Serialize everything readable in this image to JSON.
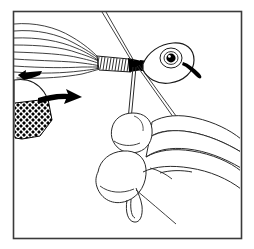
{
  "figure": {
    "title": "Fly tying step illustration",
    "description": "Black and white line drawing of a fishing fly being tied: hair fibers flare to the left, a thread wrap band binds them behind an oval head with an eye, and a hand below pinches a thread loop.",
    "width_px": 254,
    "height_px": 249,
    "style": "pen-and-ink line art",
    "background_color": "#ffffff",
    "line_color": "#1a1a1a",
    "fill_color": "#000000",
    "border": {
      "label": "frame border",
      "color": "#3a3a3a",
      "stroke_width": 1.6,
      "x": 13,
      "y": 11,
      "width": 228,
      "height": 227
    }
  },
  "parts": {
    "hair_wing": {
      "label": "hair wing fibers",
      "count": 9,
      "color": "#2a2a2a"
    },
    "thread_wrap": {
      "label": "thread wrap band",
      "hatch_lines": 13,
      "color": "#1a1a1a"
    },
    "head": {
      "label": "jig head",
      "color": "#1a1a1a"
    },
    "eye": {
      "label": "painted eye",
      "pupil_color": "#000000",
      "highlight_color": "#ffffff",
      "ring_color": "#1a1a1a"
    },
    "hook_point": {
      "label": "hook point and barb",
      "color": "#000000"
    },
    "hook_bend": {
      "label": "hook bend",
      "color": "#1a1a1a"
    },
    "mesh_patch": {
      "label": "crosshatched mesh wedge",
      "color": "#000000"
    },
    "hand": {
      "label": "hand holding thread",
      "color": "#2a2a2a",
      "fingers": 2
    },
    "thread_loop": {
      "label": "thread loop",
      "color": "#2a2a2a"
    },
    "thread_tag": {
      "label": "thread tag end",
      "color": "#2a2a2a"
    },
    "standing_threads": {
      "label": "standing thread pair",
      "color": "#2a2a2a"
    }
  },
  "arrows": [
    {
      "name": "arrow-left-small",
      "label": "pull direction arrow (left)",
      "direction": "left",
      "color": "#000000"
    },
    {
      "name": "arrow-right-large",
      "label": "push direction arrow (right)",
      "direction": "right",
      "color": "#000000"
    },
    {
      "name": "arrow-head-spike",
      "label": "hook eye spike",
      "direction": "down-right",
      "color": "#000000"
    }
  ]
}
